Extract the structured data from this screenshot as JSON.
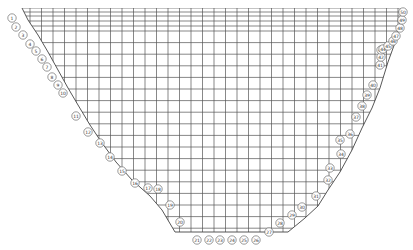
{
  "diagram": {
    "type": "finite-difference mesh of a valley cross-section",
    "grid": {
      "x_start": 22,
      "x_end": 403,
      "y_start": 8,
      "y_end": 240,
      "col_spacing": 11.5,
      "row_spacing": 11.6,
      "top_rows_dense": [
        8,
        12,
        16,
        21,
        26,
        31
      ]
    },
    "boundary": {
      "left": [
        [
          22,
          8
        ],
        [
          28,
          20
        ],
        [
          38,
          35
        ],
        [
          48,
          52
        ],
        [
          58,
          70
        ],
        [
          68,
          88
        ],
        [
          78,
          105
        ],
        [
          90,
          125
        ],
        [
          102,
          143
        ],
        [
          116,
          162
        ],
        [
          132,
          180
        ],
        [
          150,
          196
        ],
        [
          162,
          210
        ],
        [
          175,
          232
        ]
      ],
      "bottom": [
        [
          175,
          232
        ],
        [
          288,
          232
        ]
      ],
      "right": [
        [
          288,
          232
        ],
        [
          305,
          218
        ],
        [
          318,
          206
        ],
        [
          328,
          190
        ],
        [
          340,
          172
        ],
        [
          352,
          150
        ],
        [
          362,
          128
        ],
        [
          372,
          108
        ],
        [
          380,
          88
        ],
        [
          388,
          62
        ],
        [
          396,
          40
        ],
        [
          403,
          8
        ]
      ]
    },
    "markers": [
      {
        "label": "1",
        "x": 12,
        "y": 18
      },
      {
        "label": "2",
        "x": 16,
        "y": 27
      },
      {
        "label": "3",
        "x": 23,
        "y": 35
      },
      {
        "label": "4",
        "x": 30,
        "y": 44
      },
      {
        "label": "5",
        "x": 36,
        "y": 51
      },
      {
        "label": "6",
        "x": 42,
        "y": 59
      },
      {
        "label": "7",
        "x": 47,
        "y": 67
      },
      {
        "label": "8",
        "x": 52,
        "y": 77
      },
      {
        "label": "9",
        "x": 58,
        "y": 85
      },
      {
        "label": "10",
        "x": 63,
        "y": 93
      },
      {
        "label": "11",
        "x": 76,
        "y": 116
      },
      {
        "label": "12",
        "x": 88,
        "y": 132
      },
      {
        "label": "13",
        "x": 100,
        "y": 143
      },
      {
        "label": "14",
        "x": 110,
        "y": 157
      },
      {
        "label": "15",
        "x": 122,
        "y": 171
      },
      {
        "label": "16",
        "x": 135,
        "y": 183
      },
      {
        "label": "17",
        "x": 148,
        "y": 188
      },
      {
        "label": "18",
        "x": 158,
        "y": 189
      },
      {
        "label": "19",
        "x": 170,
        "y": 205
      },
      {
        "label": "20",
        "x": 180,
        "y": 222
      },
      {
        "label": "21",
        "x": 197,
        "y": 240
      },
      {
        "label": "22",
        "x": 209,
        "y": 240
      },
      {
        "label": "23",
        "x": 220,
        "y": 240
      },
      {
        "label": "24",
        "x": 232,
        "y": 240
      },
      {
        "label": "25",
        "x": 244,
        "y": 240
      },
      {
        "label": "26",
        "x": 256,
        "y": 240
      },
      {
        "label": "27",
        "x": 269,
        "y": 232
      },
      {
        "label": "28",
        "x": 280,
        "y": 223
      },
      {
        "label": "29",
        "x": 292,
        "y": 215
      },
      {
        "label": "30",
        "x": 302,
        "y": 207
      },
      {
        "label": "31",
        "x": 316,
        "y": 196
      },
      {
        "label": "32",
        "x": 328,
        "y": 180
      },
      {
        "label": "33",
        "x": 330,
        "y": 168
      },
      {
        "label": "34",
        "x": 341,
        "y": 154
      },
      {
        "label": "35",
        "x": 340,
        "y": 140
      },
      {
        "label": "36",
        "x": 350,
        "y": 134
      },
      {
        "label": "37",
        "x": 356,
        "y": 117
      },
      {
        "label": "38",
        "x": 362,
        "y": 106
      },
      {
        "label": "39",
        "x": 367,
        "y": 95
      },
      {
        "label": "40",
        "x": 373,
        "y": 85
      },
      {
        "label": "41",
        "x": 380,
        "y": 65
      },
      {
        "label": "42",
        "x": 381,
        "y": 57
      },
      {
        "label": "43",
        "x": 381,
        "y": 50
      },
      {
        "label": "44",
        "x": 383,
        "y": 49
      },
      {
        "label": "45",
        "x": 388,
        "y": 46
      },
      {
        "label": "46",
        "x": 393,
        "y": 41
      },
      {
        "label": "47",
        "x": 396,
        "y": 36
      },
      {
        "label": "48",
        "x": 400,
        "y": 28
      },
      {
        "label": "49",
        "x": 402,
        "y": 20
      },
      {
        "label": "50",
        "x": 403,
        "y": 12
      }
    ]
  }
}
